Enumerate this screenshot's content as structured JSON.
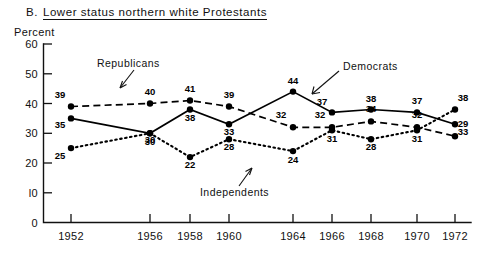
{
  "header": {
    "panel_letter": "B.",
    "title": "Lower status northern white Protestants"
  },
  "axis": {
    "y_unit_label": "Percent",
    "y_ticks": [
      "60",
      "50",
      "40",
      "30",
      "20",
      "l0",
      "0"
    ],
    "x_ticks": [
      "1952",
      "1956",
      "1958",
      "1960",
      "1964",
      "1966",
      "1968",
      "1970",
      "1972"
    ]
  },
  "annotations": {
    "republicans": "Republicans",
    "democrats": "Democrats",
    "independents": "Independents"
  },
  "chart_data": {
    "type": "line",
    "xlabel": "",
    "ylabel": "Percent",
    "ylim": [
      0,
      60
    ],
    "grid": false,
    "legend": "inline-annotations",
    "categories": [
      "1952",
      "1956",
      "1958",
      "1960",
      "1964",
      "1966",
      "1968",
      "1970",
      "1972"
    ],
    "series": [
      {
        "name": "Republicans",
        "style": "dashed",
        "values": [
          39,
          40,
          41,
          39,
          32,
          32,
          34,
          32,
          29
        ],
        "labels": [
          "39",
          "40",
          "41",
          "39",
          "32",
          "32",
          "34",
          "32",
          "29"
        ]
      },
      {
        "name": "Democrats",
        "style": "solid",
        "values": [
          35,
          30,
          38,
          33,
          44,
          37,
          38,
          37,
          33
        ],
        "labels": [
          "35",
          "30",
          "38",
          "33",
          "44",
          "37",
          "38",
          "37",
          "33"
        ]
      },
      {
        "name": "Independents",
        "style": "dotted",
        "values": [
          25,
          30,
          22,
          28,
          24,
          31,
          28,
          31,
          38
        ],
        "labels": [
          "25",
          "30",
          "22",
          "28",
          "24",
          "31",
          "28",
          "31",
          "38"
        ]
      }
    ]
  }
}
